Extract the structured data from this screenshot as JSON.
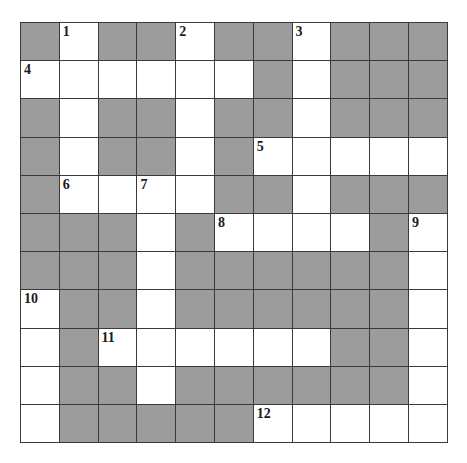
{
  "puzzle": {
    "type": "crossword-grid",
    "columns": 11,
    "rows": 11,
    "colors": {
      "open_cell": "#ffffff",
      "blocked_cell": "#9c9c9c",
      "grid_line": "#3a3a3a",
      "number_text": "#1a1a1a",
      "page_background": "#ffffff"
    },
    "legend": {
      "open": "open (white) letter cell",
      "block": "blocked (gray) cell"
    },
    "grid": [
      [
        "block",
        "open",
        "block",
        "block",
        "open",
        "block",
        "block",
        "open",
        "block",
        "block",
        "block"
      ],
      [
        "open",
        "open",
        "open",
        "open",
        "open",
        "open",
        "block",
        "open",
        "block",
        "block",
        "block"
      ],
      [
        "block",
        "open",
        "block",
        "block",
        "open",
        "block",
        "block",
        "open",
        "block",
        "block",
        "block"
      ],
      [
        "block",
        "open",
        "block",
        "block",
        "open",
        "block",
        "open",
        "open",
        "open",
        "open",
        "open"
      ],
      [
        "block",
        "open",
        "open",
        "open",
        "open",
        "block",
        "block",
        "open",
        "block",
        "block",
        "block"
      ],
      [
        "block",
        "block",
        "block",
        "open",
        "block",
        "open",
        "open",
        "open",
        "open",
        "block",
        "open"
      ],
      [
        "block",
        "block",
        "block",
        "open",
        "block",
        "block",
        "block",
        "block",
        "block",
        "block",
        "open"
      ],
      [
        "open",
        "block",
        "block",
        "open",
        "block",
        "block",
        "block",
        "block",
        "block",
        "block",
        "open"
      ],
      [
        "open",
        "block",
        "open",
        "open",
        "open",
        "open",
        "open",
        "open",
        "block",
        "block",
        "open"
      ],
      [
        "open",
        "block",
        "block",
        "open",
        "block",
        "block",
        "block",
        "block",
        "block",
        "block",
        "open"
      ],
      [
        "open",
        "block",
        "block",
        "block",
        "block",
        "block",
        "open",
        "open",
        "open",
        "open",
        "open"
      ]
    ],
    "numbers": [
      {
        "label": "1",
        "row": 1,
        "col": 2
      },
      {
        "label": "2",
        "row": 1,
        "col": 5
      },
      {
        "label": "3",
        "row": 1,
        "col": 8
      },
      {
        "label": "4",
        "row": 2,
        "col": 1
      },
      {
        "label": "5",
        "row": 4,
        "col": 7
      },
      {
        "label": "6",
        "row": 5,
        "col": 2
      },
      {
        "label": "7",
        "row": 5,
        "col": 4
      },
      {
        "label": "8",
        "row": 6,
        "col": 6
      },
      {
        "label": "9",
        "row": 6,
        "col": 11
      },
      {
        "label": "10",
        "row": 8,
        "col": 1
      },
      {
        "label": "11",
        "row": 9,
        "col": 3
      },
      {
        "label": "12",
        "row": 11,
        "col": 7
      }
    ]
  }
}
